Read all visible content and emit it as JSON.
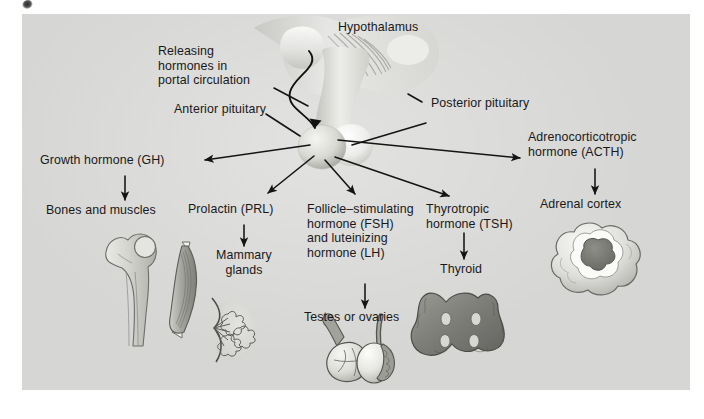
{
  "figure": {
    "title_visible": false,
    "background_color": "#d6d6d4",
    "ink_color": "#191919"
  },
  "labels": {
    "hypothalamus": "Hypothalamus",
    "releasing_hormones": "Releasing\nhormones in\nportal circulation",
    "anterior_pituitary": "Anterior pituitary",
    "posterior_pituitary": "Posterior pituitary",
    "growth_hormone": "Growth hormone (GH)",
    "bones_and_muscles": "Bones and muscles",
    "prolactin": "Prolactin (PRL)",
    "mammary_glands": "Mammary\nglands",
    "fsh_lh": "Follicle–stimulating\nhormone (FSH)\nand luteinizing\nhormone (LH)",
    "testes_or_ovaries": "Testes or ovaries",
    "tsh": "Thyrotropic\nhormone (TSH)",
    "thyroid": "Thyroid",
    "acth": "Adrenocorticotropic\nhormone (ACTH)",
    "adrenal_cortex": "Adrenal cortex"
  },
  "diagram_data": {
    "type": "diagram",
    "subject": "Hypothalamic–pituitary hormone axis",
    "source_organ": "Anterior pituitary",
    "pathways": [
      {
        "hormone": "Growth hormone (GH)",
        "abbr": "GH",
        "target": "Bones and muscles"
      },
      {
        "hormone": "Prolactin (PRL)",
        "abbr": "PRL",
        "target": "Mammary glands"
      },
      {
        "hormone": "Follicle–stimulating hormone (FSH) and luteinizing hormone (LH)",
        "abbr": "FSH / LH",
        "target": "Testes or ovaries"
      },
      {
        "hormone": "Thyrotropic hormone (TSH)",
        "abbr": "TSH",
        "target": "Thyroid"
      },
      {
        "hormone": "Adrenocorticotropic hormone (ACTH)",
        "abbr": "ACTH",
        "target": "Adrenal cortex"
      }
    ],
    "annotations": [
      "Hypothalamus",
      "Releasing hormones in portal circulation",
      "Anterior pituitary",
      "Posterior pituitary"
    ]
  }
}
